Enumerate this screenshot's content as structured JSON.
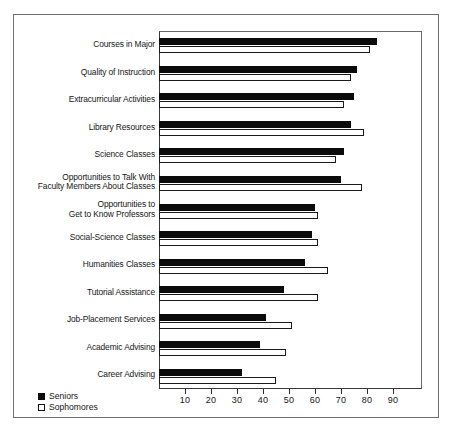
{
  "chart_data": {
    "type": "bar",
    "orientation": "horizontal",
    "title": "",
    "subtitle": "",
    "xlabel": "",
    "ylabel": "",
    "xlim": [
      0,
      100
    ],
    "xticks": [
      10,
      20,
      30,
      40,
      50,
      60,
      70,
      80,
      90
    ],
    "grid": false,
    "legend_position": "bottom-left",
    "categories": [
      "Courses in Major",
      "Quality of Instruction",
      "Extracurricular Activities",
      "Library Resources",
      "Science Classes",
      "Opportunities to Talk With\nFaculty Members About Classes",
      "Opportunities to\nGet to Know Professors",
      "Social-Science Classes",
      "Humanities Classes",
      "Tutorial Assistance",
      "Job-Placement Services",
      "Academic Advising",
      "Career Advising"
    ],
    "series": [
      {
        "name": "Seniors",
        "color": "#0b0b0b",
        "values": [
          84,
          76,
          75,
          74,
          71,
          70,
          60,
          59,
          56,
          48,
          41,
          39,
          32
        ]
      },
      {
        "name": "Sophomores",
        "color": "#ffffff",
        "values": [
          81,
          74,
          71,
          79,
          68,
          78,
          61,
          61,
          65,
          61,
          51,
          49,
          45
        ]
      }
    ]
  },
  "legend": {
    "items": [
      {
        "label": "Seniors",
        "swatch": "filled-square"
      },
      {
        "label": "Sophomores",
        "swatch": "open-square"
      }
    ]
  }
}
